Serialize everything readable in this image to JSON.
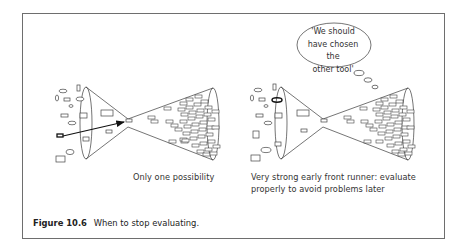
{
  "figure": {
    "label": "Figure 10.6",
    "title": "When to stop evaluating."
  },
  "panels": [
    {
      "id": "left",
      "caption_lines": [
        "Only one possibility"
      ],
      "highlight": "single candidate passes straight through the funnel (arrow)"
    },
    {
      "id": "right",
      "caption_lines": [
        "Very strong early front runner: evaluate",
        "properly to avoid problems later"
      ],
      "thought_bubble": [
        "'We should",
        "have chosen the",
        "other tool'"
      ],
      "highlight": "bold-outlined ellipse on funnel rim"
    }
  ],
  "colors": {
    "frame": "#6e6e6e",
    "line": "#3a3a3a",
    "text": "#333333"
  }
}
